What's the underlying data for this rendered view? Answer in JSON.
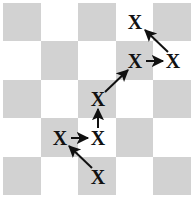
{
  "figure": {
    "type": "board-diagram"
  },
  "board": {
    "rows": 5,
    "cols": 5,
    "light_color": "#ffffff",
    "dark_color": "#d2d2d2",
    "top_left_shade": "dark",
    "origin_x": 3,
    "origin_y": 3,
    "width": 188,
    "height": 192,
    "cell_width": 37.6,
    "cell_height": 38.4,
    "squares": [
      [
        "dark",
        "light",
        "dark",
        "light",
        "dark"
      ],
      [
        "light",
        "dark",
        "light",
        "dark",
        "light"
      ],
      [
        "dark",
        "light",
        "dark",
        "light",
        "dark"
      ],
      [
        "light",
        "dark",
        "light",
        "dark",
        "light"
      ],
      [
        "dark",
        "light",
        "dark",
        "light",
        "dark"
      ]
    ]
  },
  "pieces": [
    {
      "name": "piece-r0c3",
      "glyph": "X",
      "row": 0,
      "col": 3,
      "cx": 135,
      "cy": 22,
      "square": "light"
    },
    {
      "name": "piece-r1c3",
      "glyph": "X",
      "row": 1,
      "col": 3,
      "cx": 135,
      "cy": 61,
      "square": "dark"
    },
    {
      "name": "piece-r1c4",
      "glyph": "X",
      "row": 1,
      "col": 4,
      "cx": 173,
      "cy": 61,
      "square": "light"
    },
    {
      "name": "piece-r2c2",
      "glyph": "X",
      "row": 2,
      "col": 2,
      "cx": 98,
      "cy": 99,
      "square": "dark"
    },
    {
      "name": "piece-r3c1",
      "glyph": "X",
      "row": 3,
      "col": 1,
      "cx": 60,
      "cy": 138,
      "square": "dark"
    },
    {
      "name": "piece-r3c2",
      "glyph": "X",
      "row": 3,
      "col": 2,
      "cx": 98,
      "cy": 138,
      "square": "light"
    },
    {
      "name": "piece-r4c2",
      "glyph": "X",
      "row": 4,
      "col": 2,
      "cx": 98,
      "cy": 177,
      "square": "dark"
    }
  ],
  "arrows": [
    {
      "name": "arrow-r4c2-to-r3c1",
      "from_row": 4,
      "from_col": 2,
      "to_row": 3,
      "to_col": 1,
      "x1": 92,
      "y1": 168,
      "x2": 69,
      "y2": 146,
      "kind": "diagonal-up-left"
    },
    {
      "name": "arrow-r3c1-to-r3c2",
      "from_row": 3,
      "from_col": 1,
      "to_row": 3,
      "to_col": 2,
      "x1": 71,
      "y1": 138,
      "x2": 88,
      "y2": 138,
      "kind": "horizontal-right"
    },
    {
      "name": "arrow-r3c2-to-r2c2",
      "from_row": 3,
      "from_col": 2,
      "to_row": 2,
      "to_col": 2,
      "x1": 98,
      "y1": 128,
      "x2": 98,
      "y2": 109,
      "kind": "vertical-up"
    },
    {
      "name": "arrow-r2c2-to-r1c3",
      "from_row": 2,
      "from_col": 2,
      "to_row": 1,
      "to_col": 3,
      "x1": 105,
      "y1": 92,
      "x2": 128,
      "y2": 70,
      "kind": "diagonal-up-right"
    },
    {
      "name": "arrow-r1c3-to-r1c4",
      "from_row": 1,
      "from_col": 3,
      "to_row": 1,
      "to_col": 4,
      "x1": 146,
      "y1": 61,
      "x2": 163,
      "y2": 61,
      "kind": "horizontal-right"
    },
    {
      "name": "arrow-r1c4-to-r0c3",
      "from_row": 1,
      "from_col": 4,
      "to_row": 0,
      "to_col": 3,
      "x1": 168,
      "y1": 52,
      "x2": 145,
      "y2": 30,
      "kind": "diagonal-up-left"
    }
  ],
  "style": {
    "arrow_color": "#101010",
    "arrow_width": 2,
    "piece_color": "#111111"
  }
}
